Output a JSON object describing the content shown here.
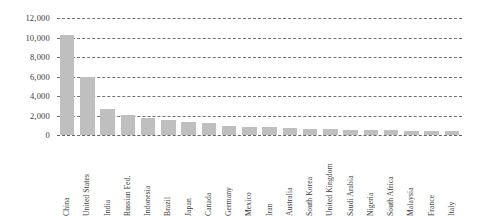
{
  "chart_data": {
    "type": "bar",
    "title": "",
    "xlabel": "",
    "ylabel": "",
    "ylim": [
      0,
      12000
    ],
    "grid": true,
    "legend": "none",
    "bar_color": "#bfbfbf",
    "yticks": [
      "0",
      "2,000",
      "4,000",
      "6,000",
      "8,000",
      "10,000",
      "12,000"
    ],
    "ytick_values": [
      0,
      2000,
      4000,
      6000,
      8000,
      10000,
      12000
    ],
    "categories": [
      "China",
      "United States",
      "India",
      "Russian Fed.",
      "Indonesia",
      "Brazil",
      "Japan",
      "Canada",
      "Germany",
      "Mexico",
      "Iran",
      "Australia",
      "South Korea",
      "United Kingdom",
      "Saudi Arabia",
      "Nigeria",
      "South Africa",
      "Malaysia",
      "France",
      "Italy"
    ],
    "values": [
      10300,
      5900,
      2650,
      2100,
      1750,
      1500,
      1350,
      1200,
      950,
      850,
      780,
      700,
      650,
      600,
      560,
      520,
      480,
      440,
      400,
      370
    ]
  }
}
